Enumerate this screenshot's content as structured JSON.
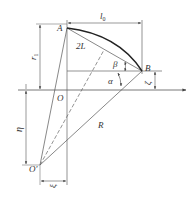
{
  "diagram": {
    "colors": {
      "line": "#555555",
      "arc": "#222222",
      "text": "#333333"
    },
    "points": {
      "A": {
        "label": "A"
      },
      "B": {
        "label": "B"
      },
      "O": {
        "label": "O"
      },
      "O_prime": {
        "label": "O′"
      }
    },
    "dimensions": {
      "l0": {
        "label": "l",
        "sub": "0"
      },
      "r1": {
        "label": "r",
        "sub": "1"
      },
      "zeta": {
        "label": "ζ"
      },
      "eta": {
        "label": "η"
      },
      "xi": {
        "label": "ξ"
      }
    },
    "labels": {
      "chord": "2L",
      "radius": "R",
      "beta": "β",
      "alpha": "α"
    }
  }
}
